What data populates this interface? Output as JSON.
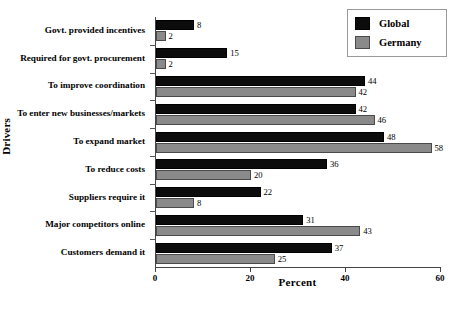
{
  "chart_data": {
    "type": "bar",
    "orientation": "horizontal",
    "title": "",
    "xlabel": "Percent",
    "ylabel": "Drivers",
    "xlim": [
      0,
      60
    ],
    "xticks": [
      0,
      20,
      40,
      60
    ],
    "grid": false,
    "legend_position": "top-right",
    "categories": [
      "Govt. provided incentives",
      "Required for govt. procurement",
      "To improve coordination",
      "To enter new businesses/markets",
      "To expand market",
      "To reduce costs",
      "Suppliers require it",
      "Major competitors online",
      "Customers demand it"
    ],
    "series": [
      {
        "name": "Global",
        "color": "#0c0c0c",
        "values": [
          8,
          15,
          44,
          42,
          48,
          36,
          22,
          31,
          37
        ]
      },
      {
        "name": "Germany",
        "color": "#8a8a8a",
        "values": [
          2,
          2,
          42,
          46,
          58,
          20,
          8,
          43,
          25
        ]
      }
    ]
  },
  "axis": {
    "x_title": "Percent",
    "y_title": "Drivers",
    "tick_labels": [
      "0",
      "20",
      "40",
      "60"
    ]
  },
  "legend": {
    "items": [
      {
        "label": "Global",
        "swatch": "black-swatch"
      },
      {
        "label": "Germany",
        "swatch": "gray-swatch"
      }
    ]
  },
  "caption": {
    "clipped_text": ""
  }
}
